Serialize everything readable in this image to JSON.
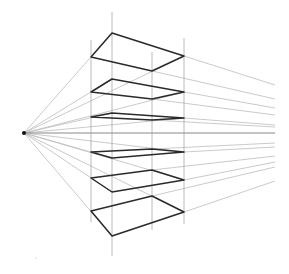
{
  "diagram": {
    "type": "one-point-perspective",
    "width": 289,
    "height": 274,
    "colors": {
      "background": "#ffffff",
      "plane_stroke": "#2a2a2a",
      "guide_stroke": "#bdbdbd",
      "vertical_stroke": "#a8a8a8",
      "horizon_stroke": "#8a8a8a",
      "vanishing_point": "#111111"
    },
    "vanishing_point": {
      "x": 24,
      "y": 133
    },
    "horizon": {
      "x1": 24,
      "y1": 133,
      "x2": 275,
      "y2": 133
    },
    "verticals": [
      {
        "x": 91,
        "y1": 40,
        "y2": 222
      },
      {
        "x": 112,
        "y1": 12,
        "y2": 256
      },
      {
        "x": 152,
        "y1": 52,
        "y2": 230
      },
      {
        "x": 184,
        "y1": 38,
        "y2": 224
      }
    ],
    "guides": [
      {
        "x1": 24,
        "y1": 133,
        "x2": 112,
        "y2": 33
      },
      {
        "x1": 24,
        "y1": 133,
        "x2": 112,
        "y2": 79
      },
      {
        "x1": 24,
        "y1": 133,
        "x2": 112,
        "y2": 113
      },
      {
        "x1": 24,
        "y1": 133,
        "x2": 112,
        "y2": 158
      },
      {
        "x1": 24,
        "y1": 133,
        "x2": 112,
        "y2": 192
      },
      {
        "x1": 24,
        "y1": 133,
        "x2": 112,
        "y2": 236
      },
      {
        "x1": 24,
        "y1": 133,
        "x2": 184,
        "y2": 56
      },
      {
        "x1": 24,
        "y1": 133,
        "x2": 184,
        "y2": 92
      },
      {
        "x1": 24,
        "y1": 133,
        "x2": 184,
        "y2": 118
      },
      {
        "x1": 24,
        "y1": 133,
        "x2": 184,
        "y2": 152
      },
      {
        "x1": 24,
        "y1": 133,
        "x2": 184,
        "y2": 180
      },
      {
        "x1": 24,
        "y1": 133,
        "x2": 184,
        "y2": 212
      },
      {
        "x1": 184,
        "y1": 56,
        "x2": 275,
        "y2": 85
      },
      {
        "x1": 152,
        "y1": 71,
        "x2": 275,
        "y2": 99
      },
      {
        "x1": 184,
        "y1": 92,
        "x2": 275,
        "y2": 108
      },
      {
        "x1": 152,
        "y1": 99,
        "x2": 275,
        "y2": 115
      },
      {
        "x1": 184,
        "y1": 118,
        "x2": 275,
        "y2": 125
      },
      {
        "x1": 152,
        "y1": 120,
        "x2": 275,
        "y2": 127
      },
      {
        "x1": 152,
        "y1": 149,
        "x2": 275,
        "y2": 143
      },
      {
        "x1": 184,
        "y1": 152,
        "x2": 275,
        "y2": 147
      },
      {
        "x1": 152,
        "y1": 170,
        "x2": 275,
        "y2": 156
      },
      {
        "x1": 184,
        "y1": 180,
        "x2": 275,
        "y2": 162
      },
      {
        "x1": 152,
        "y1": 196,
        "x2": 275,
        "y2": 167
      },
      {
        "x1": 184,
        "y1": 212,
        "x2": 275,
        "y2": 181
      }
    ],
    "planes": [
      {
        "name": "plane-1",
        "points": [
          [
            91,
            57
          ],
          [
            112,
            33
          ],
          [
            184,
            56
          ],
          [
            152,
            71
          ]
        ]
      },
      {
        "name": "plane-2",
        "points": [
          [
            91,
            92
          ],
          [
            112,
            79
          ],
          [
            184,
            92
          ],
          [
            152,
            99
          ]
        ]
      },
      {
        "name": "plane-3",
        "points": [
          [
            91,
            117
          ],
          [
            112,
            113
          ],
          [
            184,
            118
          ],
          [
            152,
            120
          ]
        ]
      },
      {
        "name": "plane-4",
        "points": [
          [
            91,
            152
          ],
          [
            112,
            158
          ],
          [
            184,
            152
          ],
          [
            152,
            149
          ]
        ]
      },
      {
        "name": "plane-5",
        "points": [
          [
            91,
            178
          ],
          [
            112,
            192
          ],
          [
            184,
            180
          ],
          [
            152,
            170
          ]
        ]
      },
      {
        "name": "plane-6",
        "points": [
          [
            91,
            211
          ],
          [
            112,
            236
          ],
          [
            184,
            212
          ],
          [
            152,
            196
          ]
        ]
      }
    ],
    "stray_mark": {
      "x": 36,
      "y": 258
    }
  }
}
